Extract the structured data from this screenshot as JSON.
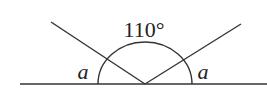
{
  "diagram": {
    "type": "angle-diagram",
    "labels": {
      "top_angle": "110°",
      "left_angle": "a",
      "right_angle": "a"
    },
    "geometry": {
      "baseline": {
        "x1": 20,
        "y1": 84,
        "x2": 267,
        "y2": 84
      },
      "vertex": {
        "x": 145,
        "y": 84
      },
      "left_ray_end": {
        "x": 51,
        "y": 22
      },
      "right_ray_end": {
        "x": 241,
        "y": 24
      },
      "arc": {
        "rx": 47,
        "ry": 42
      }
    },
    "colors": {
      "stroke": "#333333",
      "text": "#222222",
      "background": "#ffffff"
    }
  }
}
